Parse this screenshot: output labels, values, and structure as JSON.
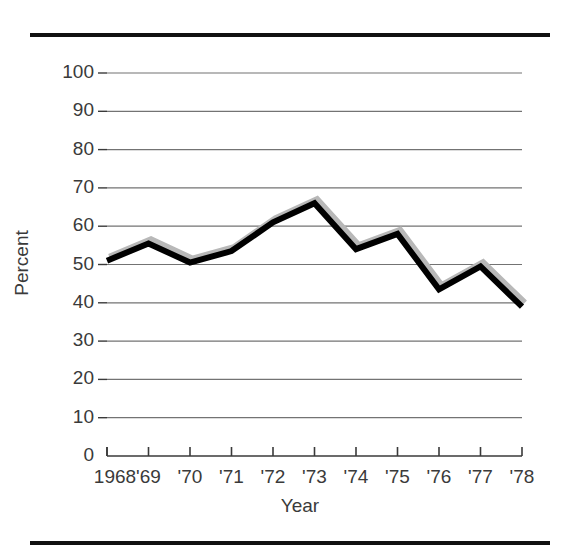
{
  "figure": {
    "top_rule": "horizontal-rule",
    "bottom_rule": "horizontal-rule"
  },
  "chart_data": {
    "type": "line",
    "title": "",
    "xlabel": "Year",
    "ylabel": "Percent",
    "categories": [
      "1968",
      "'69",
      "'70",
      "'71",
      "'72",
      "'73",
      "'74",
      "'75",
      "'76",
      "'77",
      "'78"
    ],
    "x": [
      1968,
      1969,
      1970,
      1971,
      1972,
      1973,
      1974,
      1975,
      1976,
      1977,
      1978
    ],
    "values": [
      51,
      55.5,
      50.5,
      53.5,
      61,
      66,
      54,
      58,
      43.5,
      49.5,
      39
    ],
    "ylim": [
      0,
      100
    ],
    "yticks": [
      0,
      10,
      20,
      30,
      40,
      50,
      60,
      70,
      80,
      90,
      100
    ],
    "ytick_labels": [
      "0",
      "10",
      "20",
      "30",
      "40",
      "50",
      "60",
      "70",
      "80",
      "90",
      "100"
    ],
    "grid": true,
    "legend": "none",
    "series": [
      {
        "name": "Percent",
        "values": [
          51,
          55.5,
          50.5,
          53.5,
          61,
          66,
          54,
          58,
          43.5,
          49.5,
          39
        ],
        "color": "#000000",
        "shadow_color": "#b8b8b8",
        "line_width": 6
      }
    ]
  }
}
